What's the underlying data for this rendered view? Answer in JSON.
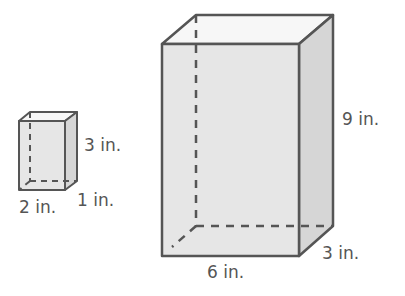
{
  "small_prism": {
    "height_label": "3 in.",
    "width_label": "2 in.",
    "depth_label": "1 in."
  },
  "large_prism": {
    "height_label": "9 in.",
    "width_label": "6 in.",
    "depth_label": "3 in."
  },
  "colors": {
    "edge": "#555555",
    "front_face": "#e6e6e6",
    "side_face": "#d6d6d6",
    "top_face": "#f7f7f7"
  }
}
